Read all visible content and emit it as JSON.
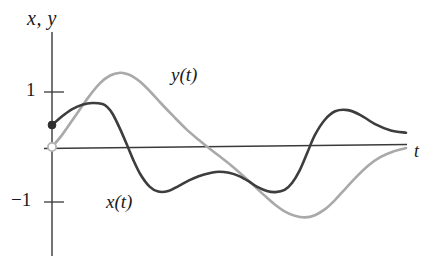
{
  "figure": {
    "background_color": "#ffffff",
    "width": 435,
    "height": 264
  },
  "axes": {
    "vertical_label": "x, y",
    "horizontal_label": "t",
    "tick_labels": {
      "positive_one": "1",
      "negative_one": "−1"
    },
    "axis_color": "#3a3a3a",
    "origin_px": {
      "x": 52,
      "y": 147
    },
    "unit_px": 55
  },
  "annotations": {
    "y_curve_label": "y(t)",
    "x_curve_label": "x(t)"
  },
  "chart_data": {
    "type": "line",
    "title": "",
    "subtitle": "",
    "xlabel": "t",
    "ylabel": "x, y",
    "grid": false,
    "legend": "inline-annotations",
    "xlim": [
      -0.13,
      7.0
    ],
    "ylim": [
      -2.1,
      2.1
    ],
    "xticks": [],
    "yticks": [
      -1,
      1
    ],
    "ytick_labels": [
      "−1",
      "1"
    ],
    "colors": {
      "x_curve": "#3d3d3d",
      "y_curve": "#a9a9a9",
      "axis": "#3a3a3a",
      "marker_x": "#2e2e2e",
      "marker_y": "#b4b4b4"
    },
    "markers": [
      {
        "name": "x-start-marker",
        "series": "x(t)",
        "x": 0.0,
        "y": 0.4,
        "style": "filled-dot"
      },
      {
        "name": "y-start-marker",
        "series": "y(t)",
        "x": 0.0,
        "y": 0.0,
        "style": "open-dot"
      }
    ],
    "series": [
      {
        "name": "x(t)",
        "label": "x(t)",
        "color": "#3d3d3d",
        "width": 2.6,
        "x": [
          0.0,
          0.2,
          0.4,
          0.6,
          0.8,
          1.0,
          1.1,
          1.2,
          1.35,
          1.5,
          1.6,
          1.75,
          1.93,
          2.1,
          2.3,
          2.5,
          2.7,
          2.9,
          3.15,
          3.3,
          3.5,
          3.7,
          3.9,
          4.05,
          4.25,
          4.42,
          4.6,
          4.75,
          4.9,
          5.05,
          5.2,
          5.4,
          5.6,
          5.85,
          6.1,
          6.4,
          6.7,
          7.0
        ],
        "y": [
          0.4,
          0.56,
          0.69,
          0.77,
          0.8,
          0.78,
          0.72,
          0.6,
          0.32,
          0.0,
          -0.22,
          -0.5,
          -0.72,
          -0.81,
          -0.8,
          -0.71,
          -0.61,
          -0.53,
          -0.47,
          -0.45,
          -0.47,
          -0.53,
          -0.63,
          -0.72,
          -0.8,
          -0.82,
          -0.78,
          -0.65,
          -0.42,
          -0.1,
          0.22,
          0.5,
          0.65,
          0.67,
          0.58,
          0.41,
          0.3,
          0.26
        ]
      },
      {
        "name": "y(t)",
        "label": "y(t)",
        "color": "#a9a9a9",
        "width": 2.6,
        "x": [
          0.0,
          0.2,
          0.45,
          0.7,
          0.95,
          1.15,
          1.35,
          1.47,
          1.6,
          1.75,
          1.95,
          2.15,
          2.4,
          2.65,
          2.9,
          3.1,
          3.3,
          3.55,
          3.8,
          4.0,
          4.2,
          4.4,
          4.6,
          4.8,
          5.0,
          5.2,
          5.4,
          5.6,
          5.8,
          6.0,
          6.25,
          6.5,
          6.75,
          7.0
        ],
        "y": [
          0.0,
          0.22,
          0.55,
          0.88,
          1.16,
          1.3,
          1.35,
          1.33,
          1.28,
          1.18,
          1.0,
          0.8,
          0.56,
          0.33,
          0.13,
          -0.02,
          -0.16,
          -0.34,
          -0.54,
          -0.71,
          -0.88,
          -1.04,
          -1.17,
          -1.25,
          -1.28,
          -1.24,
          -1.13,
          -0.96,
          -0.76,
          -0.56,
          -0.34,
          -0.18,
          -0.08,
          -0.02
        ]
      }
    ]
  }
}
